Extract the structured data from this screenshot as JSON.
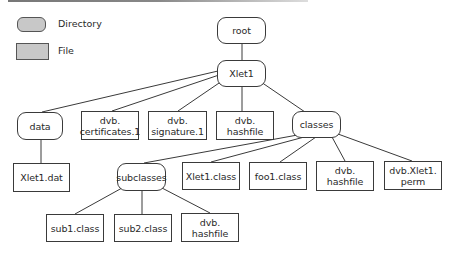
{
  "legend": {
    "directory_label": "Directory",
    "file_label": "File",
    "fill_color": "#c8c8c8"
  },
  "tree": {
    "root": "root",
    "xlet1": "Xlet1",
    "data": "data",
    "certificates": "dvb.\ncertificates.1",
    "signature": "dvb.\nsignature.1",
    "hashfile_top": "dvb.\nhashfile",
    "classes": "classes",
    "xlet1_dat": "Xlet1.dat",
    "subclasses": "subclasses",
    "xlet1_class": "Xlet1.class",
    "foo1_class": "foo1.class",
    "hashfile_classes": "dvb.\nhashfile",
    "xlet1_perm": "dvb.Xlet1.\nperm",
    "sub1_class": "sub1.class",
    "sub2_class": "sub2.class",
    "hashfile_sub": "dvb.\nhashfile"
  }
}
